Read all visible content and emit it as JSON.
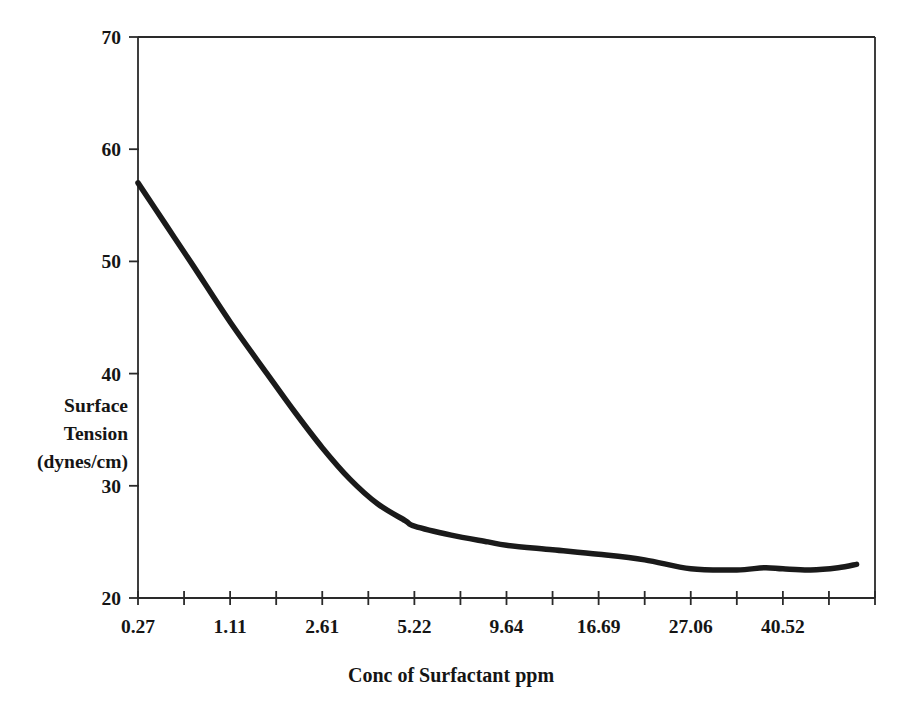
{
  "chart_data": {
    "type": "line",
    "title": "",
    "xlabel": "Conc of Surfactant ppm",
    "ylabel": "Surface Tension (dynes/cm)",
    "ylabel_lines": [
      "Surface",
      "Tension",
      "(dynes/cm)"
    ],
    "categories": [
      "0.27",
      "1.11",
      "2.61",
      "5.22",
      "9.64",
      "16.69",
      "27.06",
      "40.52"
    ],
    "xtick_labels": [
      "0.27",
      "1.11",
      "2.61",
      "5.22",
      "9.64",
      "16.69",
      "27.06",
      "40.52"
    ],
    "ytick_labels": [
      "70",
      "60",
      "50",
      "40",
      "30",
      "20"
    ],
    "ytick_values": [
      70,
      60,
      50,
      40,
      30,
      20
    ],
    "ylim": [
      20,
      70
    ],
    "xlim_index": [
      0,
      16
    ],
    "n_xticks": 17,
    "labeled_tick_step": 2,
    "grid": false,
    "legend": false,
    "legend_position": "none",
    "line_color": "#1a1a1a",
    "line_width": 5.5,
    "axis_color": "#2a2a2a",
    "background": "#ffffff",
    "series": [
      {
        "name": "Surface Tension",
        "units": "dynes/cm",
        "points": [
          {
            "tick": 0.0,
            "x_label": "0.27",
            "y": 57.0
          },
          {
            "tick": 0.6,
            "x_label": "",
            "y": 53.3
          },
          {
            "tick": 1.2,
            "x_label": "",
            "y": 49.6
          },
          {
            "tick": 2.0,
            "x_label": "1.11",
            "y": 44.6
          },
          {
            "tick": 2.8,
            "x_label": "",
            "y": 40.0
          },
          {
            "tick": 3.4,
            "x_label": "",
            "y": 36.6
          },
          {
            "tick": 4.0,
            "x_label": "2.61",
            "y": 33.4
          },
          {
            "tick": 4.6,
            "x_label": "",
            "y": 30.6
          },
          {
            "tick": 5.2,
            "x_label": "",
            "y": 28.4
          },
          {
            "tick": 5.8,
            "x_label": "",
            "y": 26.9
          },
          {
            "tick": 6.0,
            "x_label": "5.22",
            "y": 26.4
          },
          {
            "tick": 6.8,
            "x_label": "",
            "y": 25.6
          },
          {
            "tick": 7.6,
            "x_label": "",
            "y": 25.0
          },
          {
            "tick": 8.0,
            "x_label": "9.64",
            "y": 24.7
          },
          {
            "tick": 9.0,
            "x_label": "",
            "y": 24.3
          },
          {
            "tick": 10.0,
            "x_label": "16.69",
            "y": 23.9
          },
          {
            "tick": 11.0,
            "x_label": "",
            "y": 23.4
          },
          {
            "tick": 12.0,
            "x_label": "27.06",
            "y": 22.6
          },
          {
            "tick": 13.0,
            "x_label": "",
            "y": 22.5
          },
          {
            "tick": 13.6,
            "x_label": "",
            "y": 22.7
          },
          {
            "tick": 14.0,
            "x_label": "40.52",
            "y": 22.6
          },
          {
            "tick": 14.6,
            "x_label": "",
            "y": 22.5
          },
          {
            "tick": 15.2,
            "x_label": "",
            "y": 22.7
          },
          {
            "tick": 15.6,
            "x_label": "",
            "y": 23.0
          }
        ]
      }
    ],
    "annotations": []
  }
}
